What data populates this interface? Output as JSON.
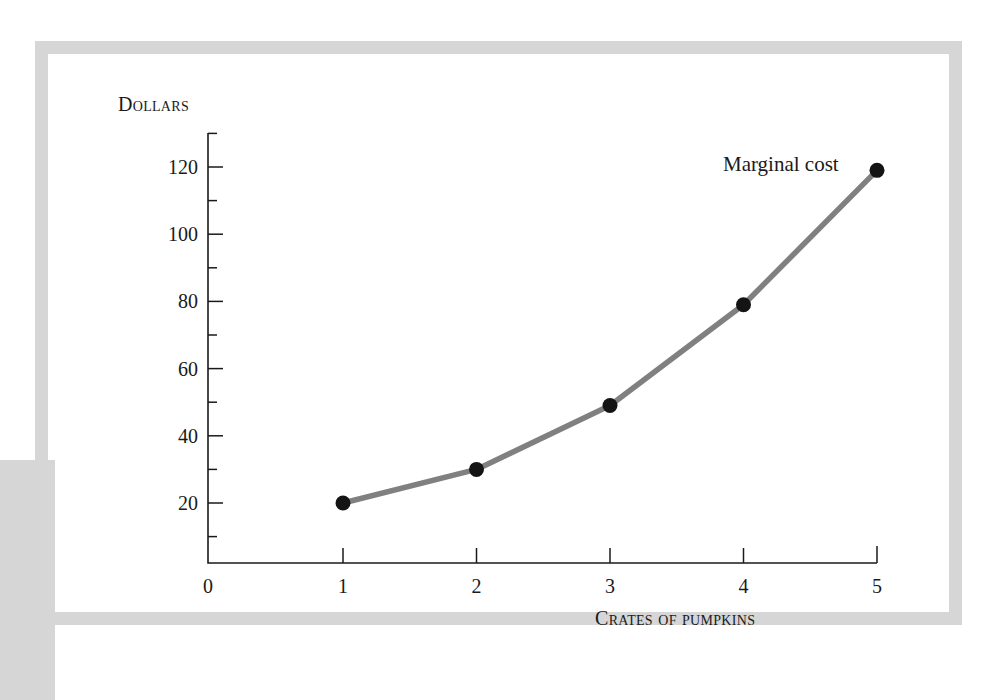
{
  "figure": {
    "background_color": "#ffffff",
    "frame_color": "#d6d6d6",
    "series_label": "Marginal cost"
  },
  "chart_data": {
    "type": "line",
    "title": "",
    "subtitle": "",
    "xlabel": "Crates of pumpkins",
    "ylabel": "Dollars",
    "xlim": [
      0,
      5
    ],
    "ylim": [
      0,
      130
    ],
    "grid": false,
    "legend_position": "inline-annotation",
    "x_tick_labels": [
      "0",
      "1",
      "2",
      "3",
      "4",
      "5"
    ],
    "x_ticks": [
      0,
      1,
      2,
      3,
      4,
      5
    ],
    "y_tick_labels": [
      "20",
      "40",
      "60",
      "80",
      "100",
      "120"
    ],
    "y_ticks": [
      20,
      40,
      60,
      80,
      100,
      120
    ],
    "y_minor_ticks": [
      10,
      30,
      50,
      70,
      90,
      110,
      130
    ],
    "series": [
      {
        "name": "Marginal cost",
        "color": "#808080",
        "marker_color": "#141414",
        "x": [
          1,
          2,
          3,
          4,
          5
        ],
        "values": [
          20,
          30,
          49,
          79,
          119
        ],
        "points": [
          {
            "x": 1,
            "y": 20
          },
          {
            "x": 2,
            "y": 30
          },
          {
            "x": 3,
            "y": 49
          },
          {
            "x": 4,
            "y": 79
          },
          {
            "x": 5,
            "y": 119
          }
        ]
      }
    ],
    "annotations": [
      {
        "text": "Marginal cost",
        "x": 4.6,
        "y": 122
      }
    ]
  }
}
